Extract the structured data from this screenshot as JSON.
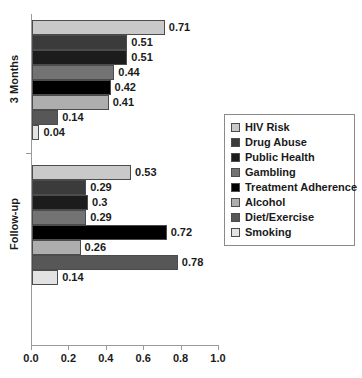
{
  "chart_data": {
    "type": "bar",
    "orientation": "horizontal",
    "title": "",
    "xlabel": "",
    "ylabel": "",
    "xlim": [
      0.0,
      1.0
    ],
    "xticks": [
      "0.0",
      "0.2",
      "0.4",
      "0.6",
      "0.8",
      "1.0"
    ],
    "xtick_values": [
      0.0,
      0.2,
      0.4,
      0.6,
      0.8,
      1.0
    ],
    "grid": false,
    "legend_position": "right",
    "categories": [
      "HIV Risk",
      "Drug Abuse",
      "Public Health",
      "Gambling",
      "Treatment Adherence",
      "Alcohol",
      "Diet/Exercise",
      "Smoking"
    ],
    "category_colors": [
      "#c9c9c9",
      "#3b3b3b",
      "#1c1c1c",
      "#737373",
      "#000000",
      "#aeaeae",
      "#575757",
      "#e2e2e2"
    ],
    "groups": [
      {
        "name": "3 Months",
        "values": [
          0.71,
          0.51,
          0.51,
          0.44,
          0.42,
          0.41,
          0.14,
          0.04
        ],
        "labels": [
          "0.71",
          "0.51",
          "0.51",
          "0.44",
          "0.42",
          "0.41",
          "0.14",
          "0.04"
        ]
      },
      {
        "name": "Follow-up",
        "values": [
          0.53,
          0.29,
          0.3,
          0.29,
          0.72,
          0.26,
          0.78,
          0.14
        ],
        "labels": [
          "0.53",
          "0.29",
          "0.3",
          "0.29",
          "0.72",
          "0.26",
          "0.78",
          "0.14"
        ]
      }
    ]
  },
  "legend": {
    "items": [
      {
        "label": "HIV Risk",
        "color": "#c9c9c9"
      },
      {
        "label": "Drug Abuse",
        "color": "#3b3b3b"
      },
      {
        "label": "Public Health",
        "color": "#1c1c1c"
      },
      {
        "label": "Gambling",
        "color": "#737373"
      },
      {
        "label": "Treatment Adherence",
        "color": "#000000"
      },
      {
        "label": "Alcohol",
        "color": "#aeaeae"
      },
      {
        "label": "Diet/Exercise",
        "color": "#575757"
      },
      {
        "label": "Smoking",
        "color": "#e2e2e2"
      }
    ]
  }
}
